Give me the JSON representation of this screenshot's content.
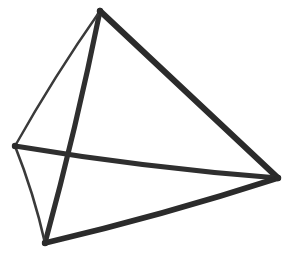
{
  "figure": {
    "title": "Tetrahedron wireframe sketch",
    "kind": "line-drawing",
    "style": "hand-drawn ink sketch",
    "canvas": {
      "width": 293,
      "height": 259,
      "background_color": "#ffffff"
    },
    "stroke_color": "#2b2b2b",
    "vertices": [
      {
        "id": "top",
        "label": "top-vertex",
        "x": 100,
        "y": 11
      },
      {
        "id": "left",
        "label": "left-vertex",
        "x": 15,
        "y": 146
      },
      {
        "id": "right",
        "label": "right-vertex",
        "x": 278,
        "y": 178
      },
      {
        "id": "bottom",
        "label": "bottom-vertex",
        "x": 45,
        "y": 243
      }
    ],
    "edges": [
      {
        "id": "top-right",
        "label": "edge-top-to-right",
        "from": "top",
        "to": "right",
        "weight": "thick",
        "stroke_width": 6.0,
        "color": "#2b2b2b",
        "sag": 0.0
      },
      {
        "id": "top-bottom",
        "label": "edge-top-to-bottom",
        "from": "top",
        "to": "bottom",
        "weight": "thick",
        "stroke_width": 5.2,
        "color": "#2f2f2f",
        "sag": -2.0
      },
      {
        "id": "left-right",
        "label": "edge-left-to-right",
        "from": "left",
        "to": "right",
        "weight": "thick",
        "stroke_width": 5.0,
        "color": "#2f2f2f",
        "sag": 3.0
      },
      {
        "id": "bottom-right",
        "label": "edge-bottom-to-right",
        "from": "bottom",
        "to": "right",
        "weight": "thick",
        "stroke_width": 5.6,
        "color": "#2b2b2b",
        "sag": 2.5
      },
      {
        "id": "top-left",
        "label": "edge-top-to-left",
        "from": "top",
        "to": "left",
        "weight": "thin",
        "stroke_width": 2.4,
        "color": "#3a3a3a",
        "sag": 2.0
      },
      {
        "id": "left-bottom",
        "label": "edge-left-to-bottom",
        "from": "left",
        "to": "bottom",
        "weight": "thin",
        "stroke_width": 2.6,
        "color": "#3a3a3a",
        "sag": -2.0
      }
    ],
    "crossings": [
      {
        "id": "center-crossing",
        "label": "edge-crossing-point",
        "x": 66,
        "y": 152,
        "edges": [
          "top-bottom",
          "left-right"
        ]
      }
    ]
  }
}
